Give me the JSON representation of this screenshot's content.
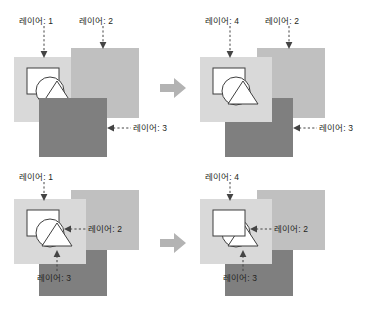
{
  "diagram": {
    "title_text": "",
    "colors": {
      "layer_light": "#d9d9d9",
      "layer_medium": "#c0c0c0",
      "layer_dark": "#7f7f7f",
      "shape_fill": "#ffffff",
      "shape_stroke": "#3f3f3f",
      "label_text": "#231f20",
      "leader_line": "#444444",
      "arrow_fill": "#b3b3b3",
      "page_background": "#ffffff"
    },
    "arrow_icon_name": "right-arrow-icon",
    "panels": [
      {
        "id": "top-left",
        "position": "top-left",
        "labels": [
          {
            "text": "레이어: 1",
            "target": "layer-light",
            "direction": "down"
          },
          {
            "text": "레이어: 2",
            "target": "layer-medium",
            "direction": "down"
          },
          {
            "text": "레이어: 3",
            "target": "layer-dark",
            "direction": "left"
          }
        ],
        "stacking_order_bottom_to_top": [
          "레이어: 1",
          "레이어: 2",
          "레이어: 3"
        ],
        "shapes_visible": "partially-occluded",
        "shapes": [
          "square",
          "circle",
          "triangle"
        ]
      },
      {
        "id": "top-right",
        "position": "top-right",
        "labels": [
          {
            "text": "레이어: 4",
            "target": "layer-light",
            "direction": "down"
          },
          {
            "text": "레이어: 2",
            "target": "layer-medium",
            "direction": "down"
          },
          {
            "text": "레이어: 3",
            "target": "layer-dark",
            "direction": "left"
          }
        ],
        "stacking_order_bottom_to_top": [
          "레이어: 2",
          "레이어: 3",
          "레이어: 4"
        ],
        "shapes_visible": "fully-visible",
        "shapes": [
          "square",
          "circle",
          "triangle"
        ]
      },
      {
        "id": "bottom-left",
        "position": "bottom-left",
        "labels": [
          {
            "text": "레이어: 1",
            "target": "layer-light",
            "direction": "down"
          },
          {
            "text": "레이어: 2",
            "target": "layer-medium",
            "direction": "left"
          },
          {
            "text": "레이어: 3",
            "target": "layer-dark",
            "direction": "up"
          }
        ],
        "stacking_order_bottom_to_top": [
          "레이어: 3",
          "레이어: 2",
          "레이어: 1"
        ],
        "shapes_visible": "fully-visible",
        "shapes": [
          "square",
          "circle",
          "triangle"
        ]
      },
      {
        "id": "bottom-right",
        "position": "bottom-right",
        "labels": [
          {
            "text": "레이어: 4",
            "target": "layer-light",
            "direction": "down"
          },
          {
            "text": "레이어: 2",
            "target": "layer-medium",
            "direction": "left"
          },
          {
            "text": "레이어: 3",
            "target": "layer-dark",
            "direction": "up"
          }
        ],
        "stacking_order_bottom_to_top": [
          "레이어: 3",
          "레이어: 2",
          "레이어: 4"
        ],
        "shapes_visible": "square-on-top",
        "shapes": [
          "square",
          "circle",
          "triangle"
        ]
      }
    ],
    "separators": [
      {
        "id": "arrow-top",
        "row": "top"
      },
      {
        "id": "arrow-bottom",
        "row": "bottom"
      }
    ]
  }
}
